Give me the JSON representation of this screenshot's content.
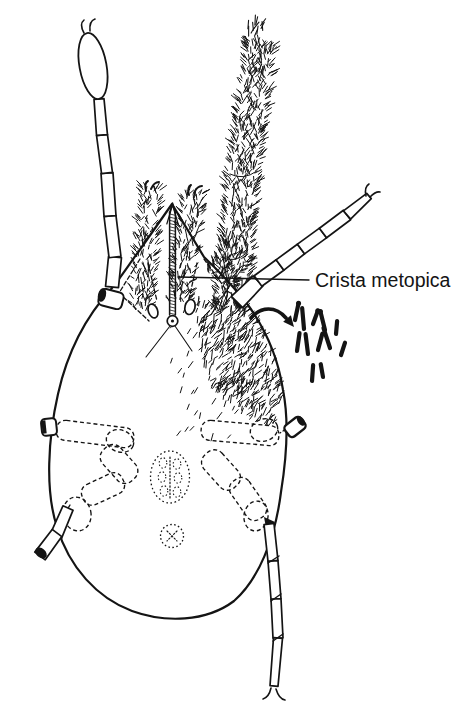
{
  "figure": {
    "label": "Crista metopica",
    "ink_color": "#141414",
    "background_color": "#ffffff"
  }
}
